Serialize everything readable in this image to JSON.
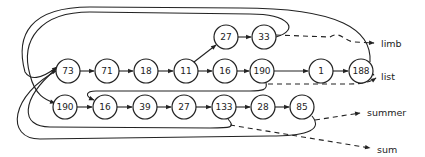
{
  "diagram": {
    "type": "linked-list-pointer-diagram",
    "nodes": [
      {
        "id": "n73",
        "value": "73",
        "x": 68,
        "y": 71
      },
      {
        "id": "n71",
        "value": "71",
        "x": 107,
        "y": 71
      },
      {
        "id": "n18",
        "value": "18",
        "x": 146,
        "y": 71
      },
      {
        "id": "n11",
        "value": "11",
        "x": 186,
        "y": 71
      },
      {
        "id": "n16a",
        "value": "16",
        "x": 225,
        "y": 71
      },
      {
        "id": "n190a",
        "value": "190",
        "x": 262,
        "y": 71
      },
      {
        "id": "n1",
        "value": "1",
        "x": 321,
        "y": 71
      },
      {
        "id": "n188",
        "value": "188",
        "x": 361,
        "y": 71
      },
      {
        "id": "n27a",
        "value": "27",
        "x": 226,
        "y": 37
      },
      {
        "id": "n33",
        "value": "33",
        "x": 264,
        "y": 37
      },
      {
        "id": "n190b",
        "value": "190",
        "x": 65,
        "y": 107
      },
      {
        "id": "n16b",
        "value": "16",
        "x": 105,
        "y": 107
      },
      {
        "id": "n39",
        "value": "39",
        "x": 145,
        "y": 107
      },
      {
        "id": "n27b",
        "value": "27",
        "x": 184,
        "y": 107
      },
      {
        "id": "n133",
        "value": "133",
        "x": 224,
        "y": 107
      },
      {
        "id": "n28",
        "value": "28",
        "x": 263,
        "y": 107
      },
      {
        "id": "n85",
        "value": "85",
        "x": 302,
        "y": 107
      }
    ],
    "labels": [
      {
        "id": "limb",
        "text": "limb",
        "x": 381,
        "y": 43
      },
      {
        "id": "list",
        "text": "list",
        "x": 381,
        "y": 76
      },
      {
        "id": "summer",
        "text": "summer",
        "x": 367,
        "y": 112
      },
      {
        "id": "sum",
        "text": "sum",
        "x": 377,
        "y": 149
      }
    ],
    "edges": [
      [
        "73",
        "71"
      ],
      [
        "71",
        "18"
      ],
      [
        "18",
        "11"
      ],
      [
        "11",
        "16"
      ],
      [
        "16",
        "190"
      ],
      [
        "190",
        "1"
      ],
      [
        "1",
        "188"
      ],
      [
        "11",
        "27"
      ],
      [
        "27",
        "33"
      ],
      [
        "190",
        "16"
      ],
      [
        "16",
        "39"
      ],
      [
        "39",
        "27"
      ],
      [
        "27",
        "133"
      ],
      [
        "133",
        "28"
      ],
      [
        "28",
        "85"
      ]
    ],
    "colors": {
      "stroke": "#222222",
      "background": "#ffffff"
    }
  }
}
